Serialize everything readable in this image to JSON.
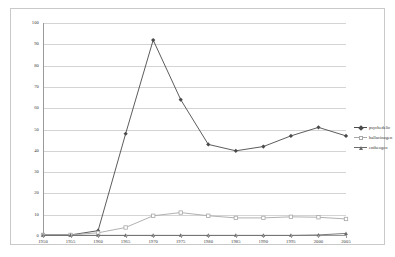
{
  "chart_data": {
    "type": "line",
    "title": "",
    "subtitle": "",
    "xlabel": "",
    "ylabel": "",
    "xlim": [
      1950,
      2005
    ],
    "ylim": [
      0,
      100
    ],
    "grid": true,
    "legend_position": "right",
    "categories": [
      "1950",
      "1955",
      "1960",
      "1965",
      "1970",
      "1975",
      "1980",
      "1985",
      "1990",
      "1995",
      "2000",
      "2005"
    ],
    "x": [
      1950,
      1955,
      1960,
      1965,
      1970,
      1975,
      1980,
      1985,
      1990,
      1995,
      2000,
      2005
    ],
    "ytick_labels": [
      "0",
      "10",
      "20",
      "30",
      "40",
      "50",
      "60",
      "70",
      "80",
      "90",
      "100"
    ],
    "yticks": [
      0,
      10,
      20,
      30,
      40,
      50,
      60,
      70,
      80,
      90,
      100
    ],
    "series": [
      {
        "name": "psychedelic",
        "color": "#4a4a4a",
        "marker": "diamond",
        "values": [
          0.5,
          0.5,
          2.5,
          48,
          92,
          64,
          43,
          40,
          42,
          47,
          51,
          47
        ]
      },
      {
        "name": "hallucinogen",
        "color": "#a8a8a8",
        "marker": "square",
        "values": [
          0.5,
          0.5,
          1.5,
          4,
          9.5,
          11,
          9.5,
          8.5,
          8.5,
          9,
          8.8,
          8
        ]
      },
      {
        "name": "entheogen",
        "color": "#6b6b6b",
        "marker": "triangle",
        "values": [
          0.3,
          0.3,
          0.3,
          0.3,
          0.3,
          0.3,
          0.3,
          0.3,
          0.3,
          0.3,
          0.5,
          1.2
        ]
      }
    ]
  },
  "legend": {
    "items": [
      {
        "label": "psychedelic"
      },
      {
        "label": "hallucinogen"
      },
      {
        "label": "entheogen"
      }
    ]
  },
  "colors": {
    "series_1": "#4a4a4a",
    "series_2": "#a8a8a8",
    "series_3": "#6b6b6b",
    "grid": "#d4d4d4",
    "axis": "#9a9a9a",
    "frame": "#c9c9c9",
    "background": "#ffffff"
  }
}
